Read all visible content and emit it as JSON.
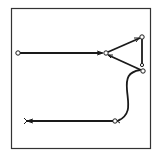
{
  "diagram": {
    "type": "line-drawing",
    "colors": {
      "stroke": "#1a1a1a",
      "background": "#ffffff",
      "frame": "#333333"
    },
    "frame": {
      "x": 11,
      "y": 8,
      "width": 139,
      "height": 140
    },
    "nodes": [
      {
        "id": "A",
        "x": 18,
        "y": 53,
        "shape": "open-circle"
      },
      {
        "id": "B",
        "x": 106,
        "y": 53,
        "shape": "open-circle"
      },
      {
        "id": "C",
        "x": 142,
        "y": 37,
        "shape": "open-circle"
      },
      {
        "id": "D",
        "x": 142,
        "y": 65,
        "shape": "open-circle"
      },
      {
        "id": "E",
        "x": 143,
        "y": 71,
        "shape": "open-circle"
      },
      {
        "id": "F",
        "x": 115,
        "y": 121,
        "shape": "open-circle"
      }
    ],
    "edges": [
      {
        "from": "A",
        "to": "B",
        "arrow_at": "B"
      },
      {
        "from": "B",
        "to": "C",
        "arrow_at": "C"
      },
      {
        "from": "B",
        "to": "E",
        "arrow_at": "B"
      },
      {
        "from": "C",
        "to": "D",
        "arrow_at": "none"
      },
      {
        "from": "E",
        "to": "F",
        "style": "curve",
        "arrow_at": "F"
      },
      {
        "from": "F",
        "to": "open-end",
        "end_marker": "fork"
      }
    ],
    "open_end": {
      "x": 26,
      "y": 121
    }
  }
}
